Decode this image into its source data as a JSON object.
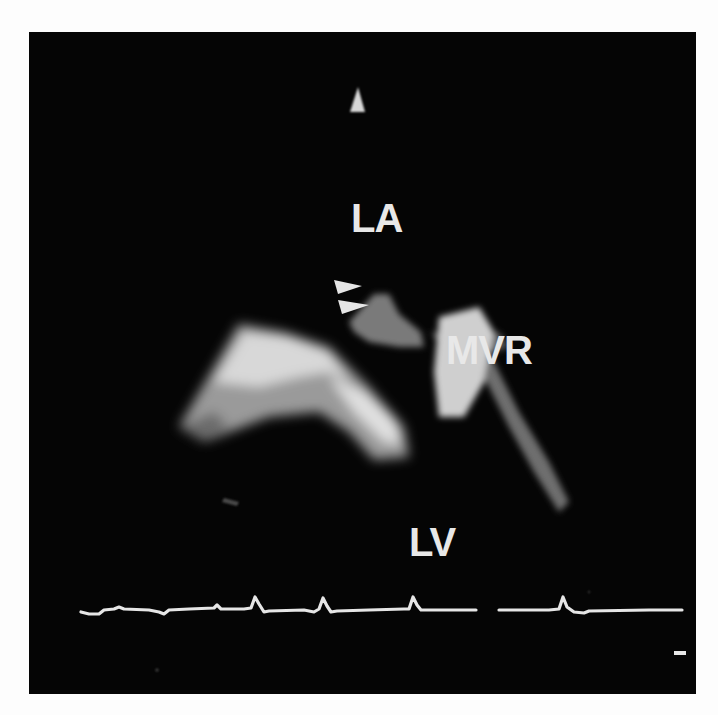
{
  "image": {
    "description": "Transesophageal echocardiogram frame showing left atrium, prosthetic mitral valve and left ventricle with ECG trace",
    "background_color": "#050505",
    "frame_color": "#fdfdfd"
  },
  "labels": {
    "la": "LA",
    "mvr": "MVR",
    "lv": "LV"
  },
  "annotations": {
    "arrowheads_count": 2,
    "orientation_marker": "triangle-marker",
    "scale_marker": "scale-bar"
  },
  "ecg": {
    "beats": 4,
    "trace_color": "#e6e6e6"
  }
}
